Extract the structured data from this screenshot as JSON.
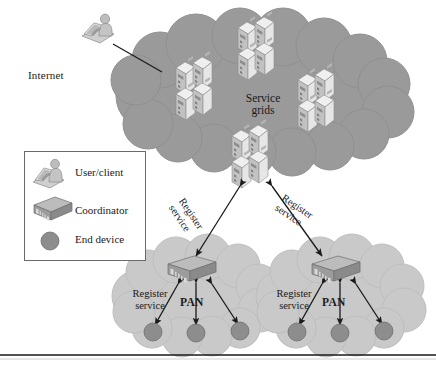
{
  "figure": {
    "type": "network-architecture-diagram",
    "background_color": "#ffffff",
    "bottom_rule_color": "#1a1a1a"
  },
  "palette": {
    "service_cloud": "#9a9a9a",
    "service_cloud_edge": "#8d8d8d",
    "pan_cloud": "#c9c9c9",
    "pan_cloud_edge": "#bdbdbd",
    "end_device": "#8d8d8d",
    "end_device_edge": "#6f6f6f",
    "server_light": "#efefef",
    "server_mid": "#cfcfcf",
    "server_dark": "#a8a8a8",
    "coordinator_top": "#b8b8b8",
    "coordinator_front": "#9c9c9c",
    "coordinator_side": "#8a8a8a",
    "arrow": "#1a1a1a",
    "legend_border": "#6a6a6a",
    "text": "#1a1a1a"
  },
  "labels": {
    "internet": "Internet",
    "service_grids": "Service grids",
    "service_grids_line1": "Service",
    "service_grids_line2": "grids",
    "pan_left": "PAN",
    "pan_right": "PAN",
    "register_service_left_line1": "Register",
    "register_service_left_line2": "service",
    "register_service_right_line1": "Register",
    "register_service_right_line2": "service",
    "register_link_left_line1": "Register",
    "register_link_left_line2": "service",
    "register_link_right_line1": "Register",
    "register_link_right_line2": "service"
  },
  "legend": {
    "items": [
      {
        "icon": "user-client-icon",
        "label": "User/client"
      },
      {
        "icon": "coordinator-icon",
        "label": "Coordinator"
      },
      {
        "icon": "end-device-icon",
        "label": "End device"
      }
    ]
  },
  "service_cloud": {
    "name": "service-grids-cloud",
    "center": [
      262,
      100
    ],
    "rx": 140,
    "ry": 62,
    "server_stacks": [
      {
        "name": "server-stack-top-center",
        "x": 238,
        "y": 28,
        "units": 4
      },
      {
        "name": "server-stack-left",
        "x": 181,
        "y": 66,
        "units": 4
      },
      {
        "name": "server-stack-right",
        "x": 300,
        "y": 78,
        "units": 4
      },
      {
        "name": "server-stack-bottom-center",
        "x": 232,
        "y": 137,
        "units": 4
      }
    ]
  },
  "pan_clouds": [
    {
      "name": "pan-cloud-left",
      "center": [
        196,
        300
      ],
      "rx": 78,
      "ry": 52,
      "coordinator": {
        "x": 168,
        "y": 258
      },
      "end_devices": [
        {
          "x": 153,
          "y": 332
        },
        {
          "x": 196,
          "y": 333
        },
        {
          "x": 240,
          "y": 331
        }
      ]
    },
    {
      "name": "pan-cloud-right",
      "center": [
        340,
        300
      ],
      "rx": 78,
      "ry": 52,
      "coordinator": {
        "x": 312,
        "y": 258
      },
      "end_devices": [
        {
          "x": 297,
          "y": 332
        },
        {
          "x": 340,
          "y": 333
        },
        {
          "x": 384,
          "y": 331
        }
      ]
    }
  ],
  "user_node": {
    "name": "user-client-node",
    "x": 86,
    "y": 18
  },
  "connections": [
    {
      "name": "internet-link",
      "from": "user-client-node",
      "to": "service-grids-cloud",
      "arrow": "none"
    },
    {
      "name": "register-link-left",
      "from": "service-grids-cloud",
      "to": "pan-cloud-left-coordinator",
      "arrow": "both",
      "label": "Register service"
    },
    {
      "name": "register-link-right",
      "from": "service-grids-cloud",
      "to": "pan-cloud-right-coordinator",
      "arrow": "both",
      "label": "Register service"
    },
    {
      "name": "pan-left-link-1",
      "from": "coordinator-left",
      "to": "end-device-left-1",
      "arrow": "both"
    },
    {
      "name": "pan-left-link-2",
      "from": "coordinator-left",
      "to": "end-device-left-2",
      "arrow": "both"
    },
    {
      "name": "pan-left-link-3",
      "from": "coordinator-left",
      "to": "end-device-left-3",
      "arrow": "both"
    },
    {
      "name": "pan-right-link-1",
      "from": "coordinator-right",
      "to": "end-device-right-1",
      "arrow": "both"
    },
    {
      "name": "pan-right-link-2",
      "from": "coordinator-right",
      "to": "end-device-right-2",
      "arrow": "both"
    },
    {
      "name": "pan-right-link-3",
      "from": "coordinator-right",
      "to": "end-device-right-3",
      "arrow": "both"
    }
  ]
}
